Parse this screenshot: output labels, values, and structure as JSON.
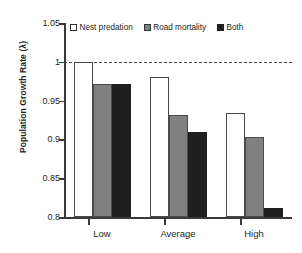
{
  "chart_data": {
    "type": "bar",
    "title": "",
    "xlabel": "",
    "ylabel": "Population Growth Rate (λ)",
    "categories": [
      "Low",
      "Average",
      "High"
    ],
    "series": [
      {
        "name": "Nest predation",
        "color": "#ffffff",
        "values": [
          1.0,
          0.981,
          0.934
        ]
      },
      {
        "name": "Road mortality",
        "color": "#808080",
        "values": [
          0.972,
          0.932,
          0.903
        ]
      },
      {
        "name": "Both",
        "color": "#1f1f1f",
        "values": [
          0.972,
          0.909,
          0.811
        ]
      }
    ],
    "ylim": [
      0.8,
      1.05
    ],
    "yticks": [
      0.8,
      0.85,
      0.9,
      0.95,
      1.0,
      1.05
    ],
    "ytick_labels": [
      "0.8",
      "0.85",
      "0.9",
      "0.95",
      "1",
      "1.05"
    ],
    "grid": false,
    "legend_position": "top",
    "reference_line": {
      "value": 1.0,
      "style": "dashed",
      "color": "#4a4a4a"
    }
  }
}
